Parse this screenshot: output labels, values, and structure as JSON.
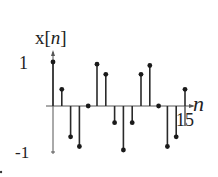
{
  "chart_data": {
    "type": "stem",
    "title": "",
    "ylabel_prefix": "x[",
    "ylabel_var": "n",
    "ylabel_suffix": "]",
    "xlabel": "n",
    "x": [
      0,
      1,
      2,
      3,
      4,
      5,
      6,
      7,
      8,
      9,
      10,
      11,
      12,
      13,
      14,
      15
    ],
    "values": [
      1.0,
      0.38,
      -0.7,
      -0.92,
      0.0,
      0.95,
      0.72,
      -0.38,
      -1.0,
      -0.38,
      0.72,
      0.92,
      0.0,
      -0.92,
      -0.7,
      0.38
    ],
    "ytick_labels": [
      "1",
      "-1"
    ],
    "xtick_labels": [
      "15"
    ],
    "ylim": [
      -1,
      1
    ],
    "xlim": [
      0,
      15
    ],
    "grid": false,
    "legend": null
  },
  "colors": {
    "line": "#2a2a2a",
    "marker": "#1a1a1a",
    "axis": "#555555"
  }
}
